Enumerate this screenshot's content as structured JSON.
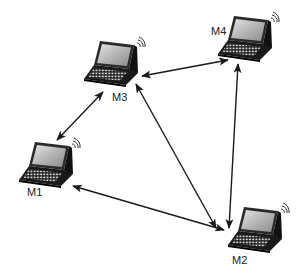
{
  "diagram": {
    "type": "ad-hoc wireless network",
    "nodes": [
      {
        "id": "M1",
        "label": "M1",
        "icon": "laptop-wireless-icon"
      },
      {
        "id": "M2",
        "label": "M2",
        "icon": "laptop-wireless-icon"
      },
      {
        "id": "M3",
        "label": "M3",
        "icon": "laptop-wireless-icon"
      },
      {
        "id": "M4",
        "label": "M4",
        "icon": "laptop-wireless-icon"
      }
    ],
    "edges": [
      {
        "from": "M1",
        "to": "M3",
        "direction": "bidirectional"
      },
      {
        "from": "M3",
        "to": "M4",
        "direction": "bidirectional"
      },
      {
        "from": "M3",
        "to": "M2",
        "direction": "bidirectional"
      },
      {
        "from": "M4",
        "to": "M2",
        "direction": "bidirectional"
      },
      {
        "from": "M1",
        "to": "M2",
        "direction": "bidirectional"
      }
    ],
    "colors": {
      "line": "#1a1a1a",
      "laptop_body": "#2a2a2a",
      "screen": "#b8b8b8",
      "label": "#222222"
    }
  }
}
